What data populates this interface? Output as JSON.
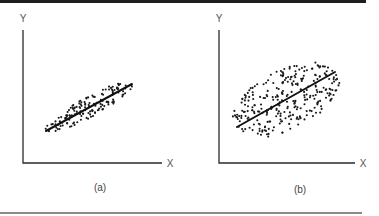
{
  "figure": {
    "top_border_color": "#1e1e1e",
    "bottom_border_color": "#8a8a8a",
    "background": "#ffffff"
  },
  "chart_data": [
    {
      "type": "scatter",
      "title": "",
      "caption": "(a)",
      "xlabel": "X",
      "ylabel": "Y",
      "grid": false,
      "legend": "none",
      "description": "Tightly clustered positively correlated scatter with fitted regression line (high correlation)",
      "regression_line": {
        "x1": 46,
        "y1": 131,
        "x2": 132,
        "y2": 84
      },
      "cloud": {
        "cx": 89,
        "cy": 107,
        "angle_deg": -28.6,
        "semi_major": 50,
        "semi_minor": 10,
        "n_points": 150,
        "seed": 7
      },
      "axes_px": {
        "origin_x": 23,
        "origin_y": 163,
        "y_top": 30,
        "x_right": 162
      },
      "labels_px": {
        "y_label": [
          23,
          22
        ],
        "x_label": [
          170,
          167
        ],
        "caption": [
          100,
          191
        ]
      }
    },
    {
      "type": "scatter",
      "title": "",
      "caption": "(b)",
      "xlabel": "X",
      "ylabel": "Y",
      "grid": false,
      "legend": "none",
      "description": "Widely dispersed positively correlated scatter with fitted regression line (low correlation)",
      "regression_line": {
        "x1": 237,
        "y1": 127,
        "x2": 335,
        "y2": 72
      },
      "cloud": {
        "cx": 286,
        "cy": 100,
        "angle_deg": -27,
        "semi_major": 58,
        "semi_minor": 30,
        "n_points": 290,
        "seed": 13
      },
      "axes_px": {
        "origin_x": 219,
        "origin_y": 163,
        "y_top": 30,
        "x_right": 355
      },
      "labels_px": {
        "y_label": [
          219,
          22
        ],
        "x_label": [
          363,
          167
        ],
        "caption": [
          300,
          193
        ]
      }
    }
  ]
}
